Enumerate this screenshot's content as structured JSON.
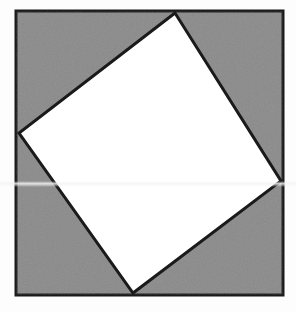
{
  "figure": {
    "canvas": {
      "width": 296,
      "height": 312,
      "background_color": "#fdfdfd"
    },
    "outer_square": {
      "name": "outer-square",
      "fill_color": "#8a8a8a",
      "stroke_color": "#1a1a1a",
      "stroke_width": 3,
      "points": "16,11 283,11 283,295 16,295",
      "corners": [
        {
          "label": "top-left",
          "x": 16,
          "y": 11
        },
        {
          "label": "top-right",
          "x": 283,
          "y": 11
        },
        {
          "label": "bottom-right",
          "x": 283,
          "y": 295
        },
        {
          "label": "bottom-left",
          "x": 16,
          "y": 295
        }
      ]
    },
    "inner_square": {
      "name": "inner-rotated-square",
      "fill_color": "#ffffff",
      "stroke_color": "#1a1a1a",
      "stroke_width": 3,
      "points": "175,13 281,181 133,293 19,133",
      "vertices": [
        {
          "label": "top",
          "x": 175,
          "y": 13
        },
        {
          "label": "right",
          "x": 281,
          "y": 181
        },
        {
          "label": "bottom",
          "x": 133,
          "y": 293
        },
        {
          "label": "left",
          "x": 19,
          "y": 133
        }
      ]
    },
    "scan_artifact": {
      "name": "scan-band",
      "top": 181,
      "color": "#f4f4f8"
    }
  }
}
